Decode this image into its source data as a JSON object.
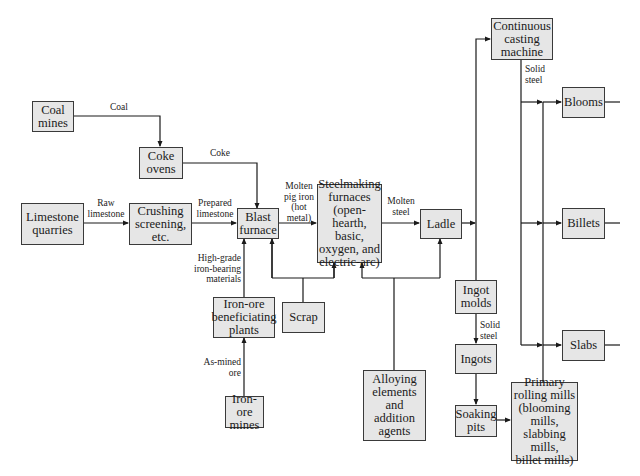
{
  "diagram": {
    "nodes": {
      "coal_mines": "Coal\nmines",
      "coke_ovens": "Coke\novens",
      "limestone_quarries": "Limestone\nquarries",
      "crushing": "Crushing\nscreening,\netc.",
      "blast_furnace": "Blast\nfurnace",
      "steelmaking": "Steelmaking\nfurnaces\n(open-hearth,\nbasic,\noxygen, and\nelectric-arc)",
      "ladle": "Ladle",
      "continuous_casting": "Continuous\ncasting\nmachine",
      "blooms": "Blooms",
      "billets": "Billets",
      "slabs": "Slabs",
      "ingot_molds": "Ingot\nmolds",
      "ingots": "Ingots",
      "soaking_pits": "Soaking\npits",
      "primary_rolling": "Primary\nrolling mills\n(blooming\nmills,\nslabbing mills,\nbillet mills)",
      "beneficiating": "Iron-ore\nbeneficiating\nplants",
      "scrap": "Scrap",
      "alloying": "Alloying\nelements\nand\naddition\nagents",
      "iron_ore_mines": "Iron-ore\nmines"
    },
    "edge_labels": {
      "coal": "Coal",
      "coke": "Coke",
      "raw_limestone": "Raw\nlimestone",
      "prepared_limestone": "Prepared\nlimestone",
      "molten_pig_iron": "Molten\npig iron\n(hot\nmetal)",
      "molten_steel": "Molten\nsteel",
      "high_grade": "High-grade\niron-bearing\nmaterials",
      "as_mined": "As-mined\nore",
      "solid_steel_cc": "Solid\nsteel",
      "solid_steel_ingot": "Solid\nsteel"
    }
  }
}
